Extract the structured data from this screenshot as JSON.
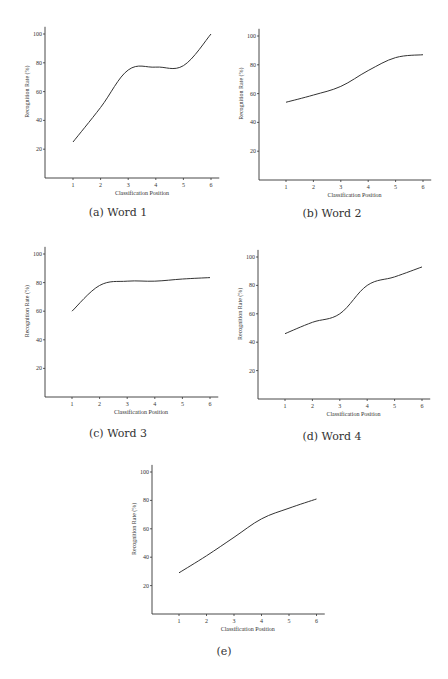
{
  "chart_data": [
    {
      "id": "a",
      "type": "line",
      "title": "",
      "caption": "(a) Word 1",
      "xlabel": "Classification Position",
      "ylabel": "Recognition Rate (%)",
      "x": [
        1,
        2,
        3,
        4,
        5,
        6
      ],
      "values": [
        25,
        49,
        75,
        77,
        78,
        100
      ],
      "xticks": [
        "1",
        "2",
        "3",
        "4",
        "5",
        "6"
      ],
      "yticks": [
        "20",
        "40",
        "60",
        "80",
        "100"
      ],
      "ylim": [
        0,
        105
      ],
      "xlim": [
        0,
        6.3
      ],
      "grid": false,
      "legend": "none"
    },
    {
      "id": "b",
      "type": "line",
      "title": "",
      "caption": "(b) Word 2",
      "xlabel": "Classification Position",
      "ylabel": "Recognition Rate (%)",
      "x": [
        1,
        2,
        3,
        4,
        5,
        6
      ],
      "values": [
        54,
        59,
        65,
        76,
        85,
        87
      ],
      "xticks": [
        "1",
        "2",
        "3",
        "4",
        "5",
        "6"
      ],
      "yticks": [
        "20",
        "40",
        "60",
        "80",
        "100"
      ],
      "ylim": [
        0,
        105
      ],
      "xlim": [
        0,
        6.3
      ],
      "grid": false,
      "legend": "none"
    },
    {
      "id": "c",
      "type": "line",
      "title": "",
      "caption": "(c) Word 3",
      "xlabel": "Classification Position",
      "ylabel": "Recognition Rate (%)",
      "x": [
        1,
        2,
        3,
        4,
        5,
        6
      ],
      "values": [
        60,
        78,
        81,
        81,
        82.5,
        83.5
      ],
      "xticks": [
        "1",
        "2",
        "3",
        "4",
        "5",
        "6"
      ],
      "yticks": [
        "20",
        "40",
        "60",
        "80",
        "100"
      ],
      "ylim": [
        0,
        105
      ],
      "xlim": [
        0,
        6.3
      ],
      "grid": false,
      "legend": "none"
    },
    {
      "id": "d",
      "type": "line",
      "title": "",
      "caption": "(d) Word 4",
      "xlabel": "Classification Position",
      "ylabel": "Recognition Rate (%)",
      "x": [
        1,
        2,
        3,
        4,
        5,
        6
      ],
      "values": [
        46,
        54,
        60,
        80,
        86,
        93
      ],
      "xticks": [
        "1",
        "2",
        "3",
        "4",
        "5",
        "6"
      ],
      "yticks": [
        "20",
        "40",
        "60",
        "80",
        "100"
      ],
      "ylim": [
        0,
        105
      ],
      "xlim": [
        0,
        6.3
      ],
      "grid": false,
      "legend": "none"
    },
    {
      "id": "e",
      "type": "line",
      "title": "",
      "caption": "(e)",
      "xlabel": "Classification Position",
      "ylabel": "Recognition Rate (%)",
      "x": [
        1,
        2,
        3,
        4,
        5,
        6
      ],
      "values": [
        29,
        41,
        54,
        67,
        74.5,
        81
      ],
      "xticks": [
        "1",
        "2",
        "3",
        "4",
        "5",
        "6"
      ],
      "yticks": [
        "20",
        "40",
        "60",
        "80",
        "100"
      ],
      "ylim": [
        0,
        105
      ],
      "xlim": [
        0,
        6.3
      ],
      "grid": false,
      "legend": "none"
    }
  ],
  "colors": {
    "line": "#333333",
    "axis": "#333333",
    "background": "#ffffff"
  }
}
